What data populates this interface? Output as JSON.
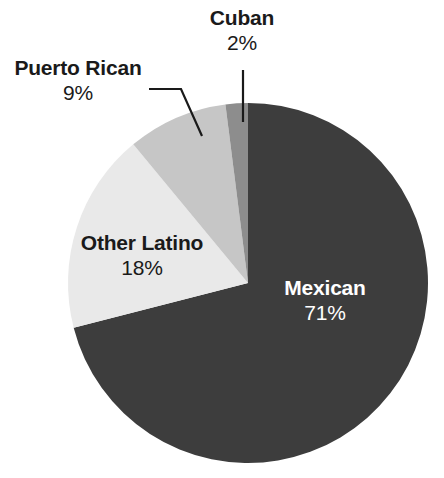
{
  "chart_data": {
    "type": "pie",
    "title": "",
    "subtitle": "",
    "xlabel": "",
    "ylabel": "",
    "grid": false,
    "legend_position": "none",
    "labels_inline": true,
    "start_angle_deg": 0,
    "direction": "counterclockwise",
    "categories": [
      "Mexican",
      "Other Latino",
      "Puerto Rican",
      "Cuban"
    ],
    "values": [
      71,
      18,
      9,
      2
    ],
    "value_suffix": "%",
    "slices": [
      {
        "label": "Mexican",
        "value": 71,
        "value_text": "71%",
        "color": "#3d3d3d",
        "text_color": "#ffffff",
        "label_placement": "inside"
      },
      {
        "label": "Other Latino",
        "value": 18,
        "value_text": "18%",
        "color": "#e9e9e9",
        "text_color": "#1a1a1a",
        "label_placement": "inside"
      },
      {
        "label": "Puerto Rican",
        "value": 9,
        "value_text": "9%",
        "color": "#c6c6c6",
        "text_color": "#1a1a1a",
        "label_placement": "outside-leader"
      },
      {
        "label": "Cuban",
        "value": 2,
        "value_text": "2%",
        "color": "#8d8d8d",
        "text_color": "#1a1a1a",
        "label_placement": "outside-leader"
      }
    ]
  },
  "colors": {
    "background": "#ffffff",
    "mexican": "#3d3d3d",
    "other_latino": "#e9e9e9",
    "puerto_rican": "#c6c6c6",
    "cuban": "#8d8d8d",
    "label_dark": "#1a1a1a",
    "label_light": "#ffffff",
    "leader_line": "#1a1a1a"
  },
  "geometry": {
    "center_x": 248,
    "center_y": 283,
    "radius": 180
  }
}
